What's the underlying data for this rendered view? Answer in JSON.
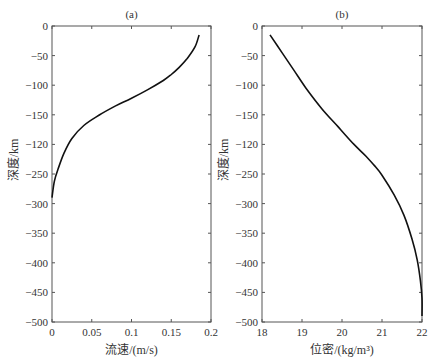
{
  "chart_data": [
    {
      "type": "line",
      "title": "(a)",
      "xlabel": "流速/(m/s)",
      "ylabel": "深度/km",
      "xlim": [
        0,
        0.2
      ],
      "ylim": [
        -500,
        0
      ],
      "xticks": [
        "0",
        "0.05",
        "0.1",
        "0.15",
        "0.2"
      ],
      "yticks": [
        "0",
        "-50",
        "-100",
        "-150",
        "-120",
        "-250",
        "-300",
        "-350",
        "-400",
        "-450",
        "-500"
      ],
      "grid": false,
      "series": [
        {
          "name": "flow velocity",
          "x": [
            0.185,
            0.18,
            0.17,
            0.16,
            0.15,
            0.14,
            0.12,
            0.1,
            0.08,
            0.06,
            0.04,
            0.025,
            0.015,
            0.008,
            0.003,
            0.0
          ],
          "y": [
            -15,
            -35,
            -55,
            -70,
            -82,
            -92,
            -108,
            -122,
            -135,
            -150,
            -168,
            -190,
            -215,
            -240,
            -262,
            -290
          ]
        }
      ]
    },
    {
      "type": "line",
      "title": "(b)",
      "xlabel": "位密/(kg/m³)",
      "ylabel": "深度/km",
      "xlim": [
        18,
        22
      ],
      "ylim": [
        -500,
        0
      ],
      "xticks": [
        "18",
        "19",
        "20",
        "21",
        "22"
      ],
      "yticks": [
        "0",
        "-50",
        "-100",
        "-150",
        "-120",
        "-250",
        "-300",
        "-350",
        "-400",
        "-450",
        "-500"
      ],
      "grid": false,
      "series": [
        {
          "name": "density",
          "x": [
            18.2,
            18.5,
            18.8,
            19.1,
            19.5,
            19.9,
            20.3,
            20.6,
            20.8,
            21.0,
            21.3,
            21.55,
            21.75,
            21.88,
            21.96,
            22.0,
            22.0
          ],
          "y": [
            -15,
            -45,
            -75,
            -105,
            -140,
            -170,
            -200,
            -220,
            -235,
            -252,
            -285,
            -320,
            -360,
            -395,
            -430,
            -460,
            -490
          ]
        }
      ]
    }
  ],
  "panels": {
    "a": {
      "title": "(a)",
      "xlabel": "流速/(m/s)",
      "ylabel": "深度/km"
    },
    "b": {
      "title": "(b)",
      "xlabel": "位密/(kg/m³)",
      "ylabel": "深度/km"
    }
  }
}
